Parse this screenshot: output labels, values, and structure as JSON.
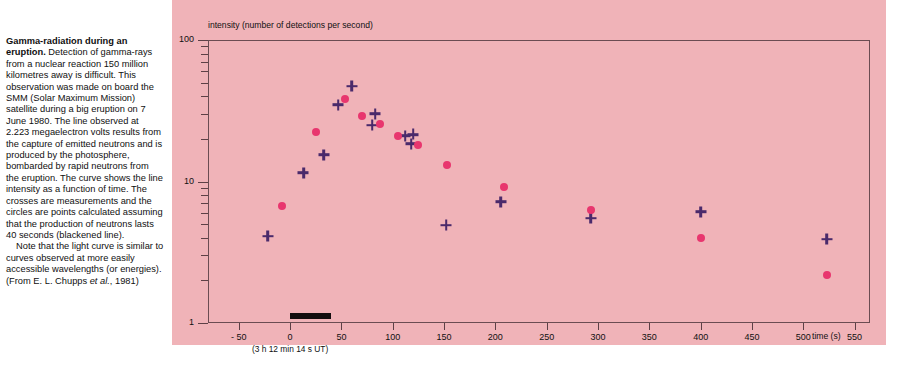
{
  "caption": {
    "title": "Gamma-radiation during an eruption.",
    "paragraph1": " Detection of gamma-rays from a nuclear reaction 150 million kilometres away is difficult. This observation was made on board the SMM (Solar Maximum Mission) satellite during a big eruption on 7 June 1980. The line observed at 2.223 megaelectron volts results from the capture of emitted neutrons and is produced by the photosphere, bombarded by rapid neutrons from the eruption. The curve shows the line intensity as a function of time. The crosses are measurements and the circles are points calculated assuming that the production of neutrons lasts 40 seconds (blackened line).",
    "paragraph2_pre": "Note that the light curve is similar to curves observed at more easily accessible wavelengths (or energies). (From E. L. Chupps ",
    "paragraph2_italic": "et al.",
    "paragraph2_post": ", 1981)"
  },
  "figure": {
    "panel_color": "#f0b3b8",
    "frame_color": "#6b4c52",
    "time_origin_note": "(3 h 12 min 14 s UT)",
    "neutron_bar": {
      "start_s": 0,
      "end_s": 40,
      "color": "#120d0e",
      "meaning": "production of neutrons lasts 40 seconds"
    }
  },
  "chart_data": {
    "type": "scatter",
    "title": "",
    "xlabel": "time (s)",
    "ylabel": "intensity (number of detections per second)",
    "xlim": [
      -80,
      565
    ],
    "ylim": [
      1,
      100
    ],
    "yscale": "log",
    "xscale": "linear",
    "grid": false,
    "legend_position": "none",
    "xticks": [
      -50,
      0,
      50,
      100,
      150,
      200,
      250,
      300,
      350,
      400,
      450,
      500,
      550
    ],
    "xtick_labels": [
      "- 50",
      "0",
      "50",
      "100",
      "150",
      "200",
      "250",
      "300",
      "350",
      "400",
      "450",
      "500",
      "550"
    ],
    "yticks": [
      1,
      10,
      100
    ],
    "ytick_labels": [
      "1",
      "10",
      "100"
    ],
    "y_minor_ticks": [
      2,
      3,
      4,
      5,
      6,
      7,
      8,
      9,
      20,
      30,
      40,
      50,
      60,
      70,
      80,
      90
    ],
    "series": [
      {
        "name": "measurements (crosses)",
        "marker": "cross",
        "color": "#4a2a6b",
        "points": [
          {
            "x": -22,
            "y": 4.1
          },
          {
            "x": 13,
            "y": 11.5
          },
          {
            "x": 33,
            "y": 15.5
          },
          {
            "x": 47,
            "y": 35.0
          },
          {
            "x": 60,
            "y": 47.0
          },
          {
            "x": 83,
            "y": 30.0
          },
          {
            "x": 80,
            "y": 25.0
          },
          {
            "x": 112,
            "y": 21.0
          },
          {
            "x": 120,
            "y": 21.5
          },
          {
            "x": 118,
            "y": 18.5
          },
          {
            "x": 152,
            "y": 4.9
          },
          {
            "x": 205,
            "y": 7.2
          },
          {
            "x": 293,
            "y": 5.5
          },
          {
            "x": 400,
            "y": 6.1
          },
          {
            "x": 523,
            "y": 3.9
          }
        ]
      },
      {
        "name": "calculated (circles)",
        "marker": "circle",
        "color": "#e8366e",
        "points": [
          {
            "x": -8,
            "y": 6.7
          },
          {
            "x": 25,
            "y": 22.5
          },
          {
            "x": 53,
            "y": 38.0
          },
          {
            "x": 70,
            "y": 29.0
          },
          {
            "x": 88,
            "y": 25.5
          },
          {
            "x": 105,
            "y": 21.0
          },
          {
            "x": 125,
            "y": 18.0
          },
          {
            "x": 153,
            "y": 13.0
          },
          {
            "x": 208,
            "y": 9.1
          },
          {
            "x": 293,
            "y": 6.3
          },
          {
            "x": 400,
            "y": 4.0
          },
          {
            "x": 523,
            "y": 2.2
          }
        ]
      }
    ]
  }
}
